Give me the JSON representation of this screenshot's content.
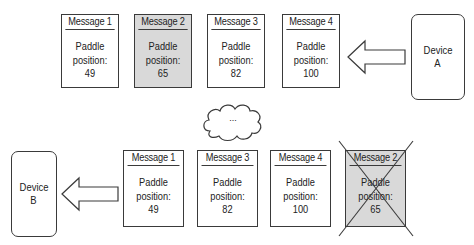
{
  "diagram": {
    "top_row": {
      "messages": [
        {
          "title": "Message 1",
          "line1": "Paddle",
          "line2": "position:",
          "value": "49",
          "highlighted": false,
          "dropped": false
        },
        {
          "title": "Message 2",
          "line1": "Paddle",
          "line2": "position:",
          "value": "65",
          "highlighted": true,
          "dropped": false
        },
        {
          "title": "Message 3",
          "line1": "Paddle",
          "line2": "position:",
          "value": "82",
          "highlighted": false,
          "dropped": false
        },
        {
          "title": "Message 4",
          "line1": "Paddle",
          "line2": "position:",
          "value": "100",
          "highlighted": false,
          "dropped": false
        }
      ],
      "device": {
        "line1": "Device",
        "line2": "A"
      },
      "arrow_direction": "left"
    },
    "network": {
      "label": "..."
    },
    "bottom_row": {
      "messages": [
        {
          "title": "Message 1",
          "line1": "Paddle",
          "line2": "position:",
          "value": "49",
          "highlighted": false,
          "dropped": false
        },
        {
          "title": "Message 3",
          "line1": "Paddle",
          "line2": "position:",
          "value": "82",
          "highlighted": false,
          "dropped": false
        },
        {
          "title": "Message 4",
          "line1": "Paddle",
          "line2": "position:",
          "value": "100",
          "highlighted": false,
          "dropped": false
        },
        {
          "title": "Message 2",
          "line1": "Paddle",
          "line2": "position:",
          "value": "65",
          "highlighted": true,
          "dropped": true
        }
      ],
      "device": {
        "line1": "Device",
        "line2": "B"
      },
      "arrow_direction": "left"
    },
    "colors": {
      "stroke": "#3a3a3a",
      "highlight_fill": "#d9d9d9",
      "background": "#ffffff"
    }
  }
}
